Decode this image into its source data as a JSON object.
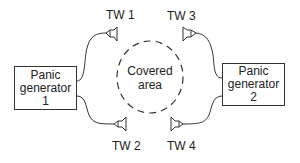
{
  "diagram": {
    "generators": [
      {
        "id": "gen1",
        "lines": [
          "Panic",
          "generator",
          "1"
        ]
      },
      {
        "id": "gen2",
        "lines": [
          "Panic",
          "generator",
          "2"
        ]
      }
    ],
    "transducers": [
      {
        "id": "tw1",
        "label": "TW 1"
      },
      {
        "id": "tw2",
        "label": "TW 2"
      },
      {
        "id": "tw3",
        "label": "TW 3"
      },
      {
        "id": "tw4",
        "label": "TW 4"
      }
    ],
    "covered_area": {
      "lines": [
        "Covered",
        "area"
      ]
    },
    "colors": {
      "stroke": "#333333",
      "background": "#ffffff"
    }
  }
}
